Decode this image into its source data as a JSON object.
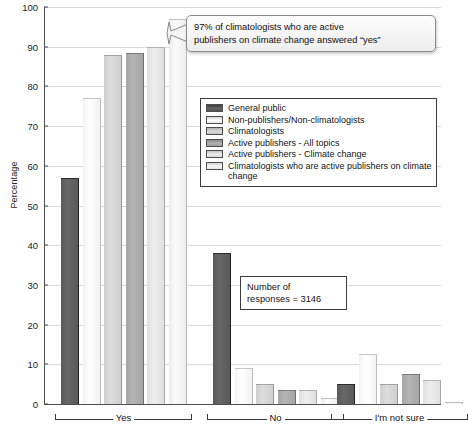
{
  "chart_data": {
    "type": "bar",
    "title": "",
    "subtitle": "",
    "xlabel": "",
    "ylabel": "Percentage",
    "ylim": [
      0,
      100
    ],
    "ytick_step": 10,
    "yticks": [
      100,
      90,
      80,
      70,
      60,
      50,
      40,
      30,
      20,
      10,
      0
    ],
    "grid": true,
    "legend_position": "upper right",
    "categories": [
      "Yes",
      "No",
      "I'm not sure"
    ],
    "series": [
      {
        "name": "General public",
        "color": "#595959",
        "values": [
          57,
          38,
          5
        ]
      },
      {
        "name": "Non-publishers/Non-climatologists",
        "color": "#f2f2f2",
        "values": [
          77,
          9,
          12.5
        ]
      },
      {
        "name": "Climatologists",
        "color": "#cfcfcf",
        "values": [
          88,
          5,
          5
        ]
      },
      {
        "name": "Active publishers - All topics",
        "color": "#a6a6a6",
        "values": [
          88.5,
          3.5,
          7.5
        ]
      },
      {
        "name": "Active publishers - Climate change",
        "color": "#e0e0e0",
        "values": [
          90,
          3.5,
          6
        ]
      },
      {
        "name": "Climatologists who are active publishers on climate change",
        "color": "#ededed",
        "values": [
          97,
          1.5,
          0.5
        ]
      }
    ],
    "annotations": [
      {
        "id": "callout-97",
        "line1": "97% of climatologists who are active",
        "line2": "publishers on climate change answered “yes”"
      },
      {
        "id": "responses-note",
        "line1": "Number of",
        "line2": "responses = 3146"
      }
    ]
  },
  "legend": {
    "items": [
      "General public",
      "Non-publishers/Non-climatologists",
      "Climatologists",
      "Active publishers - All topics",
      "Active publishers - Climate change",
      "Climatologists who are active publishers on climate change"
    ]
  },
  "axis": {
    "y_title": "Percentage",
    "y_labels": [
      "100",
      "90",
      "80",
      "70",
      "60",
      "50",
      "40",
      "30",
      "20",
      "10",
      "0"
    ],
    "group_labels": [
      "Yes",
      "No",
      "I'm not sure"
    ]
  },
  "callout": {
    "line1": "97% of climatologists who are active",
    "line2": "publishers on climate change answered “yes”"
  },
  "note": {
    "line1": "Number of",
    "line2": "responses = 3146"
  }
}
